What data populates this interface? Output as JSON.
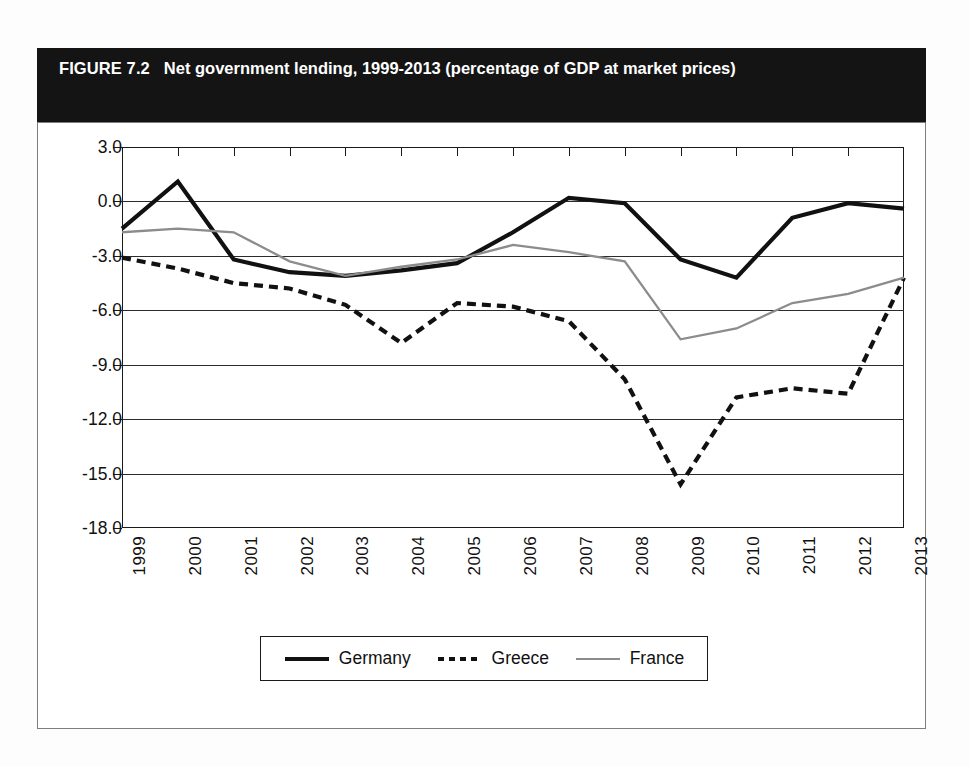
{
  "figure": {
    "number": "FIGURE 7.2",
    "title": "Net government lending, 1999-2013 (percentage of GDP at market prices)"
  },
  "colors": {
    "germany": "#111111",
    "greece": "#111111",
    "france": "#8c8c8c",
    "axis": "#1a1a1a",
    "header_bg": "#141414",
    "header_text": "#ffffff"
  },
  "chart_data": {
    "type": "line",
    "title": "Net government lending, 1999-2013 (percentage of GDP at market prices)",
    "xlabel": "",
    "ylabel": "",
    "xlim": [
      1999,
      2013
    ],
    "ylim": [
      -18.0,
      3.0
    ],
    "ytick_labels": [
      "3.0",
      "0.0",
      "-3.0",
      "-6.0",
      "-9.0",
      "-12.0",
      "-15.0",
      "-18.0"
    ],
    "ytick_values": [
      3.0,
      0.0,
      -3.0,
      -6.0,
      -9.0,
      -12.0,
      -15.0,
      -18.0
    ],
    "grid": true,
    "legend_position": "bottom",
    "categories": [
      "1999",
      "2000",
      "2001",
      "2002",
      "2003",
      "2004",
      "2005",
      "2006",
      "2007",
      "2008",
      "2009",
      "2010",
      "2011",
      "2012",
      "2013"
    ],
    "x": [
      1999,
      2000,
      2001,
      2002,
      2003,
      2004,
      2005,
      2006,
      2007,
      2008,
      2009,
      2010,
      2011,
      2012,
      2013
    ],
    "series": [
      {
        "name": "Germany",
        "style": "solid-thick",
        "color": "#111111",
        "values": [
          -1.5,
          1.1,
          -3.2,
          -3.9,
          -4.1,
          -3.8,
          -3.4,
          -1.7,
          0.2,
          -0.1,
          -3.2,
          -4.2,
          -0.9,
          -0.1,
          -0.4
        ]
      },
      {
        "name": "Greece",
        "style": "dashed",
        "color": "#111111",
        "values": [
          -3.1,
          -3.7,
          -4.5,
          -4.8,
          -5.7,
          -7.8,
          -5.6,
          -5.8,
          -6.6,
          -9.8,
          -15.6,
          -10.8,
          -10.3,
          -10.6,
          -4.2
        ]
      },
      {
        "name": "France",
        "style": "solid-thin",
        "color": "#8c8c8c",
        "values": [
          -1.7,
          -1.5,
          -1.7,
          -3.3,
          -4.1,
          -3.6,
          -3.2,
          -2.4,
          -2.8,
          -3.3,
          -7.6,
          -7.0,
          -5.6,
          -5.1,
          -4.2
        ]
      }
    ]
  },
  "legend": {
    "items": [
      {
        "label": "Germany",
        "style": "solid-thick"
      },
      {
        "label": "Greece",
        "style": "dashed"
      },
      {
        "label": "France",
        "style": "solid-thin"
      }
    ]
  }
}
